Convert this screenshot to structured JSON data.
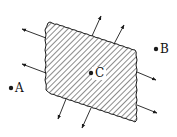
{
  "diagram": {
    "colors": {
      "stroke": "#1a1a1a",
      "background": "#ffffff"
    },
    "points": [
      {
        "id": "A",
        "label": "A",
        "x": 11,
        "y": 88
      },
      {
        "id": "B",
        "label": "B",
        "x": 156,
        "y": 49
      },
      {
        "id": "C",
        "label": "C",
        "x": 91,
        "y": 73
      }
    ]
  }
}
